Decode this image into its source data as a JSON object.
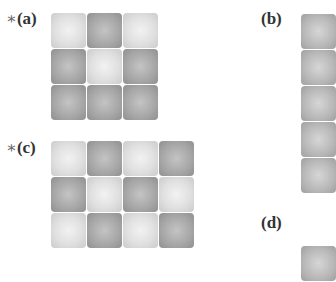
{
  "panels": [
    {
      "id": "a",
      "label": "(a)",
      "starred": true,
      "star": "∗",
      "rows": 3,
      "cols": 3,
      "cells": [
        [
          "light",
          "dark",
          "light"
        ],
        [
          "dark",
          "light",
          "dark"
        ],
        [
          "dark",
          "dark",
          "dark"
        ]
      ]
    },
    {
      "id": "b",
      "label": "(b)",
      "starred": false,
      "rows": 5,
      "cols": 1,
      "cells": [
        [
          "mid"
        ],
        [
          "mid"
        ],
        [
          "mid"
        ],
        [
          "mid"
        ],
        [
          "mid"
        ]
      ]
    },
    {
      "id": "c",
      "label": "(c)",
      "starred": true,
      "star": "∗",
      "rows": 3,
      "cols": 4,
      "cells": [
        [
          "light",
          "dark",
          "light",
          "dark"
        ],
        [
          "dark",
          "light",
          "dark",
          "light"
        ],
        [
          "light",
          "dark",
          "light",
          "dark"
        ]
      ]
    },
    {
      "id": "d",
      "label": "(d)",
      "starred": false,
      "rows": 1,
      "cols": 1,
      "cells": [
        [
          "mid"
        ]
      ]
    }
  ]
}
